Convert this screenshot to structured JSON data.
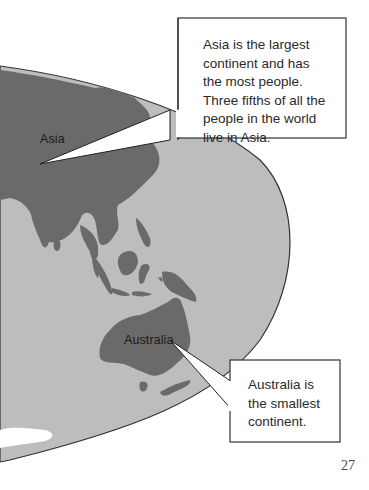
{
  "page": {
    "number": "27"
  },
  "map": {
    "ocean_color": "#bdbdbd",
    "land_color": "#6a6a6a",
    "outline_color": "#333333",
    "labels": {
      "asia": "Asia",
      "australia": "Australia"
    }
  },
  "callouts": {
    "asia": {
      "lines": [
        "Asia is the largest",
        "continent and has",
        "the most people.",
        "Three fifths of all the",
        "people in the world",
        "live in Asia."
      ]
    },
    "australia": {
      "lines": [
        "Australia is",
        "the smallest",
        "continent."
      ]
    }
  }
}
